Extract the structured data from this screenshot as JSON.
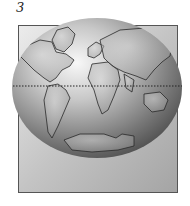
{
  "figure": {
    "label": "3",
    "colors": {
      "panel_light": "#e4e4e4",
      "panel_dark": "#a8a8a8",
      "globe_light": "#f4f4f4",
      "globe_dark": "#5a5a5a",
      "outline": "#2a2a2a"
    }
  }
}
